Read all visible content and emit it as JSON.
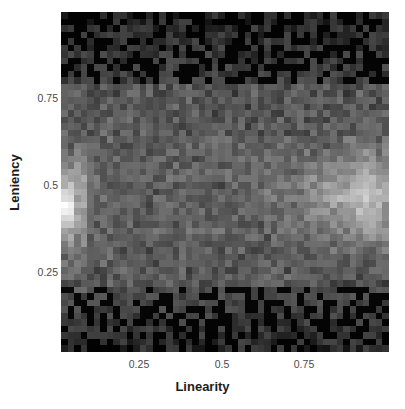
{
  "figure": {
    "background_color": "#ffffff",
    "plot": {
      "left": 61,
      "top": 12,
      "width": 328,
      "height": 340
    }
  },
  "chart_data": {
    "type": "heatmap",
    "title": "",
    "xlabel": "Linearity",
    "ylabel": "Leniency",
    "xlim": [
      0.0,
      1.0
    ],
    "ylim": [
      0.0,
      1.0
    ],
    "xticks": [
      0.25,
      0.5,
      0.75
    ],
    "xtick_labels": [
      "0.25",
      "0.5",
      "0.75"
    ],
    "yticks": [
      0.25,
      0.5,
      0.75
    ],
    "ytick_labels": [
      "0.25",
      "0.5",
      "0.75"
    ],
    "grid": false,
    "legend": false,
    "colormap": "grayscale",
    "colormap_low": "#000000",
    "colormap_high": "#ffffff",
    "n_cols": 50,
    "n_rows": 52,
    "bands": [
      {
        "name": "top-dark-band",
        "y_range": [
          0.78,
          1.0
        ],
        "mean_value": 0.04
      },
      {
        "name": "mid-bright-band",
        "y_range": [
          0.2,
          0.78
        ],
        "mean_value": 0.25
      },
      {
        "name": "bottom-dark-band",
        "y_range": [
          0.0,
          0.2
        ],
        "mean_value": 0.06
      }
    ],
    "hotspots": [
      {
        "name": "left-edge-stripe",
        "x_range": [
          0.0,
          0.03
        ],
        "y_range": [
          0.22,
          0.62
        ],
        "peak_value": 1.0
      },
      {
        "name": "right-cluster",
        "x_range": [
          0.78,
          1.0
        ],
        "y_range": [
          0.34,
          0.58
        ],
        "peak_value": 0.85
      }
    ]
  },
  "axes": {
    "x_title": "Linearity",
    "y_title": "Leniency",
    "x_ticks": [
      {
        "label": "0.25",
        "px": 139
      },
      {
        "label": "0.5",
        "px": 222
      },
      {
        "label": "0.75",
        "px": 304
      }
    ],
    "y_ticks": [
      {
        "label": "0.75",
        "px": 98
      },
      {
        "label": "0.5",
        "px": 185
      },
      {
        "label": "0.25",
        "px": 272
      }
    ]
  }
}
